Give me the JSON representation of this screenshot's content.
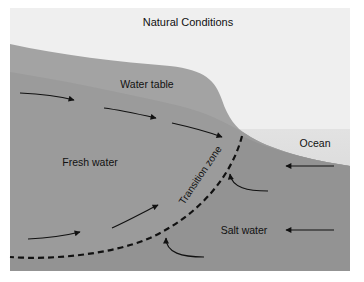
{
  "title": "Natural Conditions",
  "labels": {
    "water_table": "Water table",
    "fresh_water": "Fresh water",
    "transition_zone": "Transition zone",
    "ocean": "Ocean",
    "salt_water": "Salt water"
  },
  "colors": {
    "sky": "#eeeeee",
    "ground_unsaturated": "#a4a4a4",
    "ground_saturated": "#9a9a9a",
    "salt_region": "#8f8f8f",
    "ocean": "#d8d8d8",
    "arrow": "#111111"
  }
}
